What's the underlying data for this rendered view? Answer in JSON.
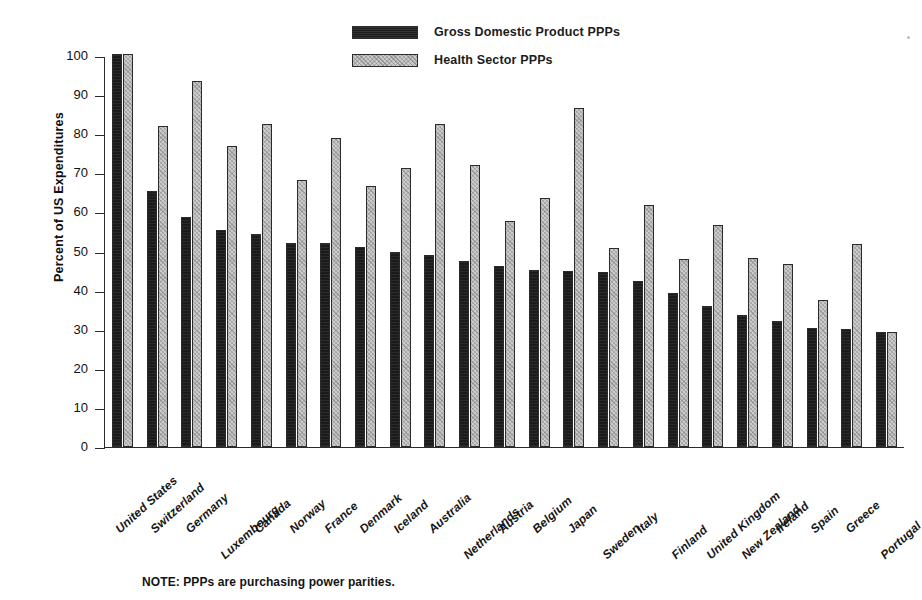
{
  "chart_data": {
    "type": "bar",
    "title": "",
    "xlabel": "",
    "ylabel": "Percent of US Expenditures",
    "ylim": [
      0,
      100
    ],
    "ytick_step": 10,
    "yticks": [
      100,
      90,
      80,
      70,
      60,
      50,
      40,
      30,
      20,
      10,
      0
    ],
    "grid": false,
    "legend_position": "top-center",
    "note": "NOTE: PPPs are purchasing power parities.",
    "categories": [
      "United States",
      "Switzerland",
      "Germany",
      "Luxembourg",
      "Canada",
      "Norway",
      "France",
      "Denmark",
      "Iceland",
      "Australia",
      "Netherlands",
      "Austria",
      "Belgium",
      "Japan",
      "Sweden",
      "Italy",
      "Finland",
      "United Kingdom",
      "New Zealand",
      "Ireland",
      "Spain",
      "Greece",
      "Portugal"
    ],
    "series": [
      {
        "name": "Gross Domestic Product PPPs",
        "color": "#1b1b1b",
        "values": [
          100.5,
          65.5,
          58.8,
          55.4,
          54.6,
          52.1,
          52.2,
          51.2,
          49.9,
          49.0,
          47.7,
          46.4,
          45.2,
          45.0,
          44.7,
          42.5,
          39.5,
          36.1,
          33.8,
          32.2,
          30.4,
          30.2,
          29.4
        ]
      },
      {
        "name": "Health Sector PPPs",
        "color": "#cbcbcb",
        "values": [
          100.5,
          82.1,
          93.7,
          76.9,
          82.5,
          68.4,
          79.0,
          66.7,
          71.3,
          82.6,
          72.0,
          57.7,
          63.7,
          86.8,
          51.0,
          61.8,
          48.2,
          56.7,
          48.3,
          46.8,
          37.7,
          52.0,
          29.4
        ]
      }
    ]
  },
  "legend": {
    "items": [
      {
        "label": "Gross Domestic Product PPPs",
        "swatch": "gdp"
      },
      {
        "label": "Health Sector PPPs",
        "swatch": "health"
      }
    ]
  }
}
